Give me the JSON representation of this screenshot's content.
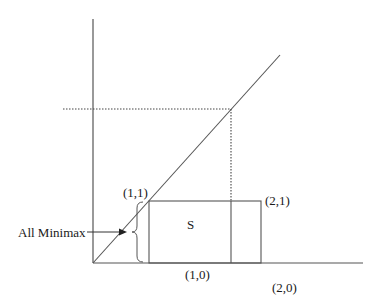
{
  "diagram": {
    "colors": {
      "line": "#555555",
      "text": "#1a1a1a",
      "background": "#ffffff"
    },
    "labels": {
      "point_1_1": "(1,1)",
      "point_2_1": "(2,1)",
      "point_1_0": "(1,0)",
      "point_2_0": "(2,0)",
      "region_s": "S",
      "all_minimax": "All Minimax"
    },
    "elements": [
      "vertical-axis",
      "horizontal-axis",
      "diagonal-45-degree-line",
      "dotted-horizontal-guide",
      "dotted-vertical-guide",
      "rectangle-S",
      "inner-vertical-divider",
      "brace",
      "arrow"
    ]
  }
}
